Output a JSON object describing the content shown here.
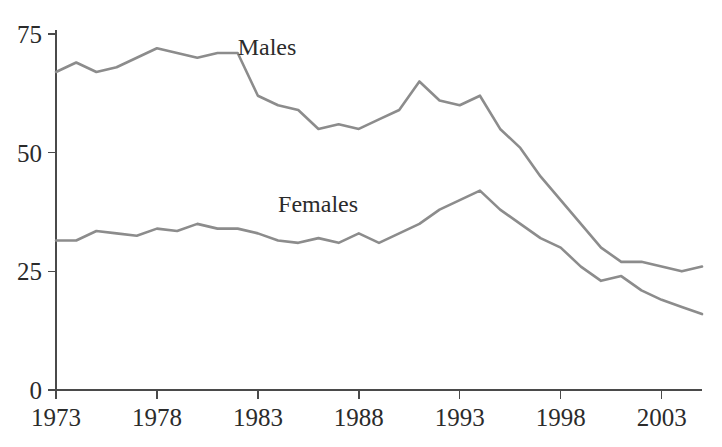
{
  "chart_data": {
    "type": "line",
    "title": "",
    "subtitle": "",
    "xlabel": "",
    "ylabel": "",
    "xlim": [
      1973,
      2005
    ],
    "ylim": [
      0,
      75
    ],
    "grid": false,
    "legend_position": "inline-labels",
    "x_ticks": [
      "1973",
      "1978",
      "1983",
      "1988",
      "1993",
      "1998",
      "2003"
    ],
    "x_tick_values": [
      1973,
      1978,
      1983,
      1988,
      1993,
      1998,
      2003
    ],
    "y_ticks": [
      "0",
      "25",
      "50",
      "75"
    ],
    "y_tick_values": [
      0,
      25,
      50,
      75
    ],
    "x": [
      1973,
      1974,
      1975,
      1976,
      1977,
      1978,
      1979,
      1980,
      1981,
      1982,
      1983,
      1984,
      1985,
      1986,
      1987,
      1988,
      1989,
      1990,
      1991,
      1992,
      1993,
      1994,
      1995,
      1996,
      1997,
      1998,
      1999,
      2000,
      2001,
      2002,
      2003,
      2004,
      2005
    ],
    "series": [
      {
        "name": "Males",
        "color": "#8c8c8c",
        "label": "Males",
        "label_x": 1982.0,
        "label_y": 70.5,
        "values": [
          67,
          69,
          67,
          68,
          70,
          72,
          71,
          70,
          71,
          71,
          62,
          60,
          59,
          55,
          56,
          55,
          57,
          59,
          65,
          61,
          60,
          62,
          55,
          51,
          45,
          40,
          35,
          30,
          27,
          27,
          26,
          25,
          26
        ]
      },
      {
        "name": "Females",
        "color": "#8c8c8c",
        "label": "Females",
        "label_x": 1984.0,
        "label_y": 37.5,
        "values": [
          31.5,
          31.5,
          33.5,
          33,
          32.5,
          34,
          33.5,
          35,
          34,
          34,
          33,
          31.5,
          31,
          32,
          31,
          33,
          31,
          33,
          35,
          38,
          40,
          42,
          38,
          35,
          32,
          30,
          26,
          23,
          24,
          21,
          19,
          17.5,
          16
        ]
      }
    ]
  },
  "axes": {
    "axis_color": "#4a4a4a",
    "line_color": "#8c8c8c"
  }
}
